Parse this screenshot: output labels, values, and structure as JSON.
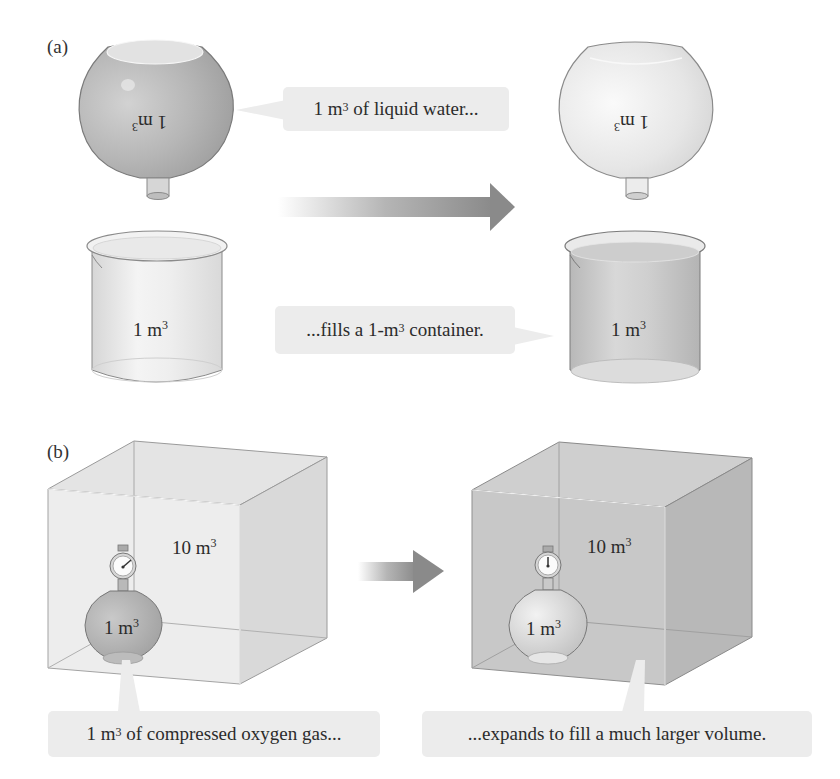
{
  "figure": {
    "panel_a": {
      "label": "(a)",
      "left_flask": {
        "volume_label": "1 m",
        "exponent": "3",
        "state": "filled with liquid water (inverted)"
      },
      "right_flask": {
        "volume_label": "1 m",
        "exponent": "3",
        "state": "empty (inverted)"
      },
      "left_beaker": {
        "volume_label": "1 m",
        "exponent": "3",
        "state": "empty"
      },
      "right_beaker": {
        "volume_label": "1 m",
        "exponent": "3",
        "state": "filled"
      },
      "callout_top": {
        "prefix": "1 m",
        "exponent": "3",
        "suffix": " of liquid water..."
      },
      "callout_bottom": {
        "prefix": "...fills a 1-m",
        "exponent": "3",
        "suffix": " container."
      },
      "arrow": "right-arrow"
    },
    "panel_b": {
      "label": "(b)",
      "left_box": {
        "volume_label": "10 m",
        "exponent": "3",
        "flask_label": "1 m",
        "flask_exponent": "3",
        "state": "empty box, gas in flask"
      },
      "right_box": {
        "volume_label": "10 m",
        "exponent": "3",
        "flask_label": "1 m",
        "flask_exponent": "3",
        "state": "gas fills box"
      },
      "callout_left": {
        "prefix": "1 m",
        "exponent": "3",
        "suffix": " of compressed oxygen gas..."
      },
      "callout_right": {
        "text": "...expands to fill a much larger volume."
      },
      "arrow": "right-arrow"
    },
    "colors": {
      "liquid_fill": "#b9b9b9",
      "glass_light": "#e9e9e9",
      "gas_fill": "#c4c4c4",
      "callout_bg": "#ececec",
      "arrow_dark": "#8c8c8c"
    }
  }
}
